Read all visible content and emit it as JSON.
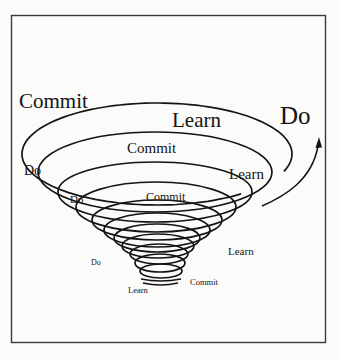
{
  "diagram": {
    "type": "conical-spiral",
    "description_visible": "Narrowing spiral of repeated Commit-Do-Learn cycles ending in an outward arrow labeled Do",
    "colors": {
      "background": "#fbfbfa",
      "line": "#141414",
      "frame": "#3a3a3a"
    },
    "labels": {
      "outer_commit": "Commit",
      "outer_learn": "Learn",
      "exit_do": "Do",
      "ring2_do": "Do",
      "ring2_commit": "Commit",
      "ring2_learn": "Learn",
      "ring3_do": "Do",
      "ring3_commit": "Commit",
      "inner_learn_right": "Learn",
      "inner_do": "Do",
      "inner_commit": "Commit",
      "bottom_learn": "Learn"
    },
    "loops": [
      {
        "cx": 157,
        "cy": 154,
        "rx": 135,
        "ry": 51
      },
      {
        "cx": 155,
        "cy": 172,
        "rx": 117,
        "ry": 40
      },
      {
        "cx": 155,
        "cy": 192,
        "rx": 97,
        "ry": 30
      },
      {
        "cx": 156,
        "cy": 207,
        "rx": 80,
        "ry": 25
      },
      {
        "cx": 157,
        "cy": 220,
        "rx": 65,
        "ry": 20
      },
      {
        "cx": 157,
        "cy": 230,
        "rx": 53,
        "ry": 17
      },
      {
        "cx": 157,
        "cy": 238,
        "rx": 43,
        "ry": 14
      },
      {
        "cx": 158,
        "cy": 246,
        "rx": 36,
        "ry": 12
      },
      {
        "cx": 159,
        "cy": 254,
        "rx": 29,
        "ry": 10
      },
      {
        "cx": 160,
        "cy": 263,
        "rx": 25,
        "ry": 9
      },
      {
        "cx": 161,
        "cy": 271,
        "rx": 21,
        "ry": 7
      }
    ]
  }
}
